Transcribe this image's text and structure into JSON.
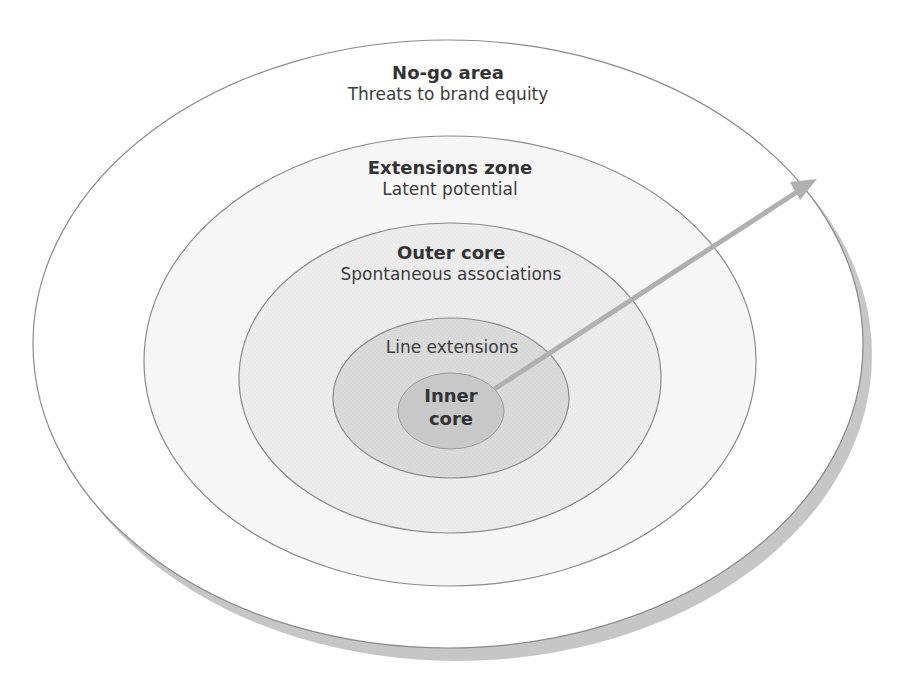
{
  "diagram": {
    "type": "concentric-ellipses",
    "colors": {
      "background": "#ffffff",
      "shadow": "#c6c6c6",
      "stroke": "#8a8a8a",
      "arrow": "#b0b0b0",
      "text": "#333333"
    },
    "rings": [
      {
        "id": "no-go-area",
        "title": "No-go area",
        "subtitle": "Threats to brand equity",
        "fill": "#ffffff",
        "cx": 448,
        "cy": 344,
        "rx": 415,
        "ry": 304
      },
      {
        "id": "extensions-zone",
        "title": "Extensions zone",
        "subtitle": "Latent potential",
        "fill": "#f6f6f6",
        "cx": 450,
        "cy": 361,
        "rx": 306,
        "ry": 225
      },
      {
        "id": "outer-core",
        "title": "Outer core",
        "subtitle": "Spontaneous associations",
        "fill": "#ececec",
        "cx": 450,
        "cy": 378,
        "rx": 211,
        "ry": 155
      },
      {
        "id": "line-extensions",
        "title": "",
        "subtitle": "Line extensions",
        "fill": "#dadada",
        "cx": 451,
        "cy": 398,
        "rx": 118,
        "ry": 80
      },
      {
        "id": "inner-core",
        "title": "Inner core",
        "title_line1": "Inner",
        "title_line2": "core",
        "subtitle": "",
        "fill": "#c8c8c8",
        "cx": 451,
        "cy": 411,
        "rx": 53,
        "ry": 38
      }
    ],
    "arrow": {
      "from": [
        496,
        388
      ],
      "to": [
        817,
        179
      ],
      "direction": "outward from inner core"
    },
    "labels": {
      "no_go_title": "No-go area",
      "no_go_subtitle": "Threats to brand equity",
      "extensions_title": "Extensions zone",
      "extensions_subtitle": "Latent potential",
      "outer_core_title": "Outer core",
      "outer_core_subtitle": "Spontaneous associations",
      "line_extensions": "Line extensions",
      "inner_core_line1": "Inner",
      "inner_core_line2": "core"
    }
  }
}
